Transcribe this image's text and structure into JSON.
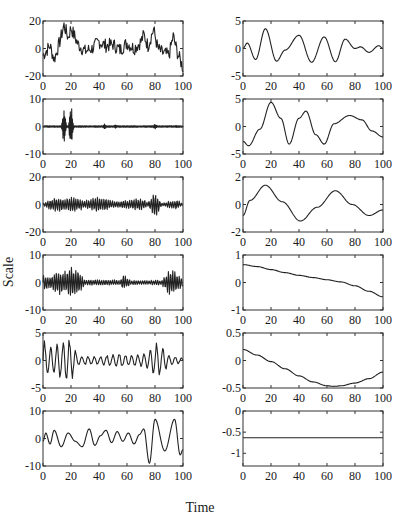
{
  "figure": {
    "ylabel": "Scale",
    "xlabel": "Time"
  },
  "chart_data": {
    "type": "line",
    "title": "",
    "xlabel": "Time",
    "ylabel": "Scale",
    "layout": {
      "rows": 6,
      "cols": 2,
      "grid": false,
      "legend": "none"
    },
    "panels": [
      {
        "id": "L1",
        "row": 1,
        "col": 1,
        "xlim": [
          0,
          100
        ],
        "ylim": [
          -20,
          20
        ],
        "yticks": [
          -20,
          0,
          20
        ],
        "xticks": [
          0,
          20,
          40,
          60,
          80,
          100
        ],
        "description": "Noisy high-frequency signal with low-frequency trend; peaks near t=15 (~17), t=20 (~15), t=72 (~10), t=79 (~14), t=93 (~9); minimum ~-14 at t=100",
        "x": [
          0,
          5,
          8,
          12,
          15,
          18,
          20,
          25,
          30,
          35,
          40,
          45,
          50,
          55,
          60,
          65,
          70,
          72,
          75,
          79,
          82,
          85,
          90,
          93,
          96,
          100
        ],
        "y": [
          -5,
          2,
          -8,
          5,
          17,
          8,
          15,
          3,
          -2,
          0,
          5,
          2,
          3,
          -1,
          4,
          0,
          5,
          10,
          2,
          14,
          0,
          -3,
          -5,
          9,
          -3,
          -14
        ]
      },
      {
        "id": "R1",
        "row": 1,
        "col": 2,
        "xlim": [
          0,
          100
        ],
        "ylim": [
          -5,
          5
        ],
        "yticks": [
          -5,
          0,
          5
        ],
        "xticks": [
          0,
          20,
          40,
          60,
          80,
          100
        ],
        "x": [
          0,
          3,
          9,
          16,
          24,
          30,
          40,
          49,
          58,
          66,
          73,
          80,
          84,
          90,
          97,
          100
        ],
        "y": [
          0,
          1,
          -2,
          3.6,
          -2.3,
          -0.3,
          2.4,
          -2.5,
          2.1,
          -2.4,
          1.7,
          0,
          0.3,
          -0.7,
          0.5,
          0
        ]
      },
      {
        "id": "L2",
        "row": 2,
        "col": 1,
        "xlim": [
          0,
          100
        ],
        "ylim": [
          -10,
          10
        ],
        "yticks": [
          -10,
          0,
          10
        ],
        "xticks": [
          0,
          20,
          40,
          60,
          80,
          100
        ],
        "description": "Near-zero signal with two large bursts at t~15 (+6/-7) and t~20 (+7.5/-9.5); small bursts at t~44, 52, 80",
        "bursts": [
          {
            "t": 15,
            "max": 6,
            "min": -7
          },
          {
            "t": 20,
            "max": 7.5,
            "min": -9.5
          },
          {
            "t": 44,
            "max": 1,
            "min": -1
          },
          {
            "t": 52,
            "max": 0.8,
            "min": -0.8
          },
          {
            "t": 80,
            "max": 1,
            "min": -1
          },
          {
            "t": 95,
            "max": 0.5,
            "min": -0.5
          }
        ]
      },
      {
        "id": "R2",
        "row": 2,
        "col": 2,
        "xlim": [
          0,
          100
        ],
        "ylim": [
          -5,
          5
        ],
        "yticks": [
          -5,
          0,
          5
        ],
        "xticks": [
          0,
          20,
          40,
          60,
          80,
          100
        ],
        "x": [
          0,
          4,
          12,
          20,
          27,
          33,
          40,
          45,
          52,
          58,
          65,
          76,
          85,
          92,
          100
        ],
        "y": [
          -2.7,
          -3.5,
          -0.5,
          4.4,
          1.5,
          -3.2,
          1.5,
          2.8,
          -1.5,
          -3.2,
          0.5,
          2.0,
          1.2,
          -0.8,
          -1.9
        ]
      },
      {
        "id": "L3",
        "row": 3,
        "col": 1,
        "xlim": [
          0,
          100
        ],
        "ylim": [
          -20,
          20
        ],
        "yticks": [
          -20,
          0,
          20
        ],
        "xticks": [
          0,
          20,
          40,
          60,
          80,
          100
        ],
        "description": "High-frequency oscillation, amplitude ~4-8, spike at t~80 (+9/-11)",
        "envelope": {
          "t": [
            0,
            8,
            15,
            22,
            30,
            40,
            50,
            60,
            70,
            75,
            80,
            85,
            95,
            100
          ],
          "amp": [
            1,
            6,
            5,
            6,
            3,
            6,
            3,
            3,
            5,
            2,
            10,
            1,
            4,
            1
          ]
        }
      },
      {
        "id": "R3",
        "row": 3,
        "col": 2,
        "xlim": [
          0,
          100
        ],
        "ylim": [
          -2,
          2
        ],
        "yticks": [
          -2,
          0,
          2
        ],
        "xticks": [
          0,
          20,
          40,
          60,
          80,
          100
        ],
        "x": [
          0,
          5,
          16,
          28,
          41,
          53,
          66,
          78,
          90,
          100
        ],
        "y": [
          -0.8,
          0.3,
          1.4,
          0.2,
          -1.2,
          -0.2,
          1.0,
          0,
          -0.8,
          -0.4
        ]
      },
      {
        "id": "L4",
        "row": 4,
        "col": 1,
        "xlim": [
          0,
          100
        ],
        "ylim": [
          -10,
          10
        ],
        "yticks": [
          -10,
          0,
          10
        ],
        "xticks": [
          0,
          20,
          40,
          60,
          80,
          100
        ],
        "description": "Oscillation with bursts at t~10-25 (amp ~6), t~58 (amp ~3), t~90-98 (amp ~5); small amp ~1 elsewhere",
        "envelope": {
          "t": [
            0,
            5,
            10,
            15,
            20,
            25,
            30,
            45,
            55,
            58,
            62,
            70,
            85,
            90,
            95,
            100
          ],
          "amp": [
            4,
            2,
            5,
            4,
            6,
            5,
            1,
            1.2,
            1,
            3,
            1,
            0.8,
            1,
            5,
            4,
            2
          ]
        }
      },
      {
        "id": "R4",
        "row": 4,
        "col": 2,
        "xlim": [
          0,
          100
        ],
        "ylim": [
          -1,
          1
        ],
        "yticks": [
          -1,
          0,
          1
        ],
        "xticks": [
          0,
          20,
          40,
          60,
          80,
          100
        ],
        "x": [
          0,
          10,
          20,
          30,
          40,
          50,
          60,
          70,
          80,
          90,
          100
        ],
        "y": [
          0.65,
          0.58,
          0.47,
          0.36,
          0.26,
          0.18,
          0.1,
          0.02,
          -0.12,
          -0.32,
          -0.52
        ]
      },
      {
        "id": "L5",
        "row": 5,
        "col": 1,
        "xlim": [
          0,
          100
        ],
        "ylim": [
          -5,
          5
        ],
        "yticks": [
          -5,
          0,
          5
        ],
        "xticks": [
          0,
          20,
          40,
          60,
          80,
          100
        ],
        "description": "Oscillation with large swings at t~0-20 (~±4.5) and t~75-85 (~±3.5), small ~±1 elsewhere",
        "envelope": {
          "t": [
            0,
            3,
            10,
            16,
            19,
            25,
            40,
            55,
            65,
            75,
            80,
            85,
            90,
            100
          ],
          "amp": [
            4.5,
            3,
            3,
            4.5,
            4.5,
            1,
            0.8,
            1.5,
            1,
            1.5,
            3.5,
            3,
            1,
            0.5
          ]
        }
      },
      {
        "id": "R5",
        "row": 5,
        "col": 2,
        "xlim": [
          0,
          100
        ],
        "ylim": [
          -0.5,
          0.5
        ],
        "yticks": [
          -0.5,
          0,
          0.5
        ],
        "xticks": [
          0,
          20,
          40,
          60,
          80,
          100
        ],
        "x": [
          0,
          10,
          20,
          30,
          40,
          50,
          60,
          65,
          70,
          80,
          90,
          100
        ],
        "y": [
          0.2,
          0.1,
          -0.02,
          -0.15,
          -0.28,
          -0.39,
          -0.46,
          -0.47,
          -0.46,
          -0.41,
          -0.33,
          -0.21
        ]
      },
      {
        "id": "L6",
        "row": 6,
        "col": 1,
        "xlim": [
          0,
          100
        ],
        "ylim": [
          -10,
          10
        ],
        "yticks": [
          -10,
          0,
          10
        ],
        "xticks": [
          0,
          20,
          40,
          60,
          80,
          100
        ],
        "x": [
          0,
          2,
          5,
          8,
          13,
          18,
          23,
          28,
          33,
          37,
          41,
          45,
          49,
          53,
          57,
          61,
          65,
          69,
          72,
          76,
          80,
          87,
          94,
          98,
          100
        ],
        "y": [
          -1,
          2,
          -2,
          3,
          -3,
          2,
          -1,
          -3,
          3.5,
          -2.5,
          1,
          3,
          -1.5,
          2.5,
          -1,
          2,
          -2,
          1.5,
          3.5,
          -9,
          7,
          -4.5,
          7,
          -6,
          -4
        ]
      },
      {
        "id": "R6",
        "row": 6,
        "col": 2,
        "xlim": [
          0,
          100
        ],
        "ylim": [
          -1.3,
          0
        ],
        "yticks": [
          -1,
          -0.5,
          0
        ],
        "xticks": [
          0,
          20,
          40,
          60,
          80,
          100
        ],
        "x": [
          0,
          100
        ],
        "y": [
          -0.63,
          -0.63
        ]
      }
    ]
  }
}
